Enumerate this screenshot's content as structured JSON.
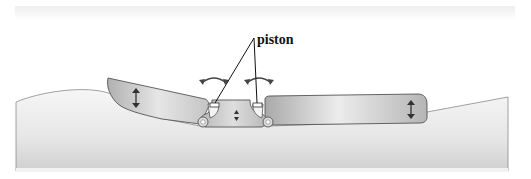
{
  "diagram": {
    "type": "mechanical-schematic",
    "labels": {
      "piston": "piston"
    },
    "components": [
      {
        "id": "left-flap",
        "icon": "vertical-double-arrow-icon"
      },
      {
        "id": "center-hull",
        "icon": "small-vertical-double-arrow-icon"
      },
      {
        "id": "right-flap",
        "icon": "vertical-double-arrow-icon"
      },
      {
        "id": "left-piston",
        "icon": "curved-double-arrow-icon"
      },
      {
        "id": "right-piston",
        "icon": "curved-double-arrow-icon"
      },
      {
        "id": "left-hinge"
      },
      {
        "id": "right-hinge"
      },
      {
        "id": "water-surface"
      }
    ],
    "colors": {
      "background": "#ffffff",
      "water_top": "#f4f4f4",
      "water_bottom": "#cfcfcf",
      "flap_light": "#e8e8e8",
      "flap_dark": "#a8a8a8",
      "outline": "#555555",
      "arrow": "#333333",
      "text": "#111111"
    }
  }
}
